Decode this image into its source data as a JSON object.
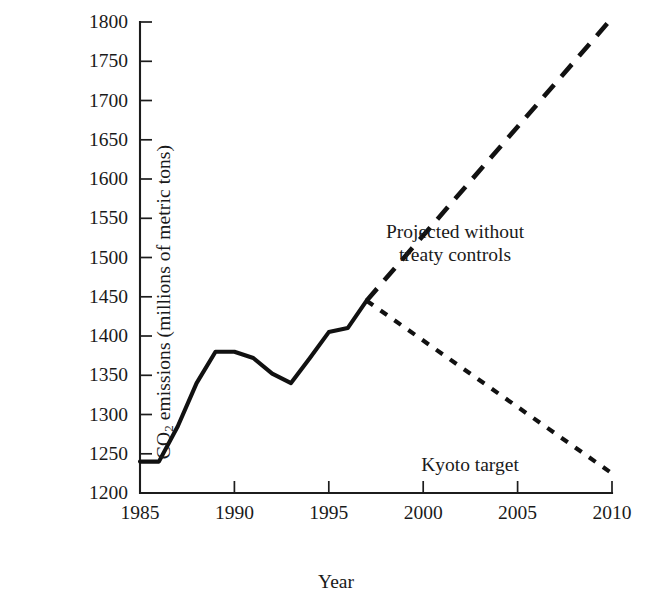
{
  "chart_data": {
    "type": "line",
    "title": "",
    "xlabel": "Year",
    "ylabel_full": "CO2 emissions (millions of metric tons)",
    "ylabel_prefix": "CO",
    "ylabel_sub": "2",
    "ylabel_suffix": " emissions (millions of metric tons)",
    "xlim": [
      1985,
      2010
    ],
    "ylim": [
      1200,
      1800
    ],
    "grid": false,
    "legend_position": "inline-annotations",
    "xticks": [
      1985,
      1990,
      1995,
      2000,
      2005,
      2010
    ],
    "xtick_labels": [
      "1985",
      "1990",
      "1995",
      "2000",
      "2005",
      "2010"
    ],
    "yticks": [
      1200,
      1250,
      1300,
      1350,
      1400,
      1450,
      1500,
      1550,
      1600,
      1650,
      1700,
      1750,
      1800
    ],
    "ytick_labels": [
      "1200",
      "1250",
      "1300",
      "1350",
      "1400",
      "1450",
      "1500",
      "1550",
      "1600",
      "1650",
      "1700",
      "1750",
      "1800"
    ],
    "series": [
      {
        "name": "Historical emissions",
        "style": "solid",
        "x": [
          1985,
          1986,
          1987,
          1988,
          1989,
          1990,
          1991,
          1992,
          1993,
          1994,
          1995,
          1996,
          1997
        ],
        "values": [
          1240,
          1240,
          1285,
          1340,
          1380,
          1380,
          1372,
          1352,
          1340,
          1372,
          1405,
          1410,
          1445
        ]
      },
      {
        "name": "Projected without treaty controls",
        "style": "dashed-long",
        "x": [
          1997,
          2010
        ],
        "values": [
          1445,
          1805
        ]
      },
      {
        "name": "Kyoto target",
        "style": "dashed-short",
        "x": [
          1997,
          2010
        ],
        "values": [
          1445,
          1225
        ]
      }
    ],
    "annotations": [
      {
        "name": "projected-label",
        "line1": "Projected without",
        "line2": "treaty controls",
        "target_series": "Projected without treaty controls"
      },
      {
        "name": "kyoto-label",
        "line1": "Kyoto target",
        "target_series": "Kyoto target"
      }
    ]
  }
}
